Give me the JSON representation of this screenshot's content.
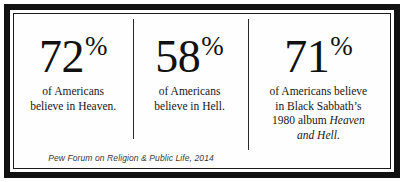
{
  "infographic": {
    "source_note": "Pew Forum on Religion & Public Life, 2014",
    "columns": [
      {
        "stat_number": "72",
        "stat_percent_symbol": "%",
        "caption_line_1": "of Americans",
        "caption_line_2": "believe in Heaven.",
        "caption_line_3": "",
        "caption_line_4": ""
      },
      {
        "stat_number": "58",
        "stat_percent_symbol": "%",
        "caption_line_1": "of Americans",
        "caption_line_2": "believe in Hell.",
        "caption_line_3": "",
        "caption_line_4": ""
      },
      {
        "stat_number": "71",
        "stat_percent_symbol": "%",
        "caption_line_1": "of Americans believe",
        "caption_line_2": "in Black Sabbath’s",
        "caption_line_3_plain": "1980 album ",
        "caption_line_3_italic": "Heaven",
        "caption_line_4_italic": "and Hell."
      }
    ]
  }
}
